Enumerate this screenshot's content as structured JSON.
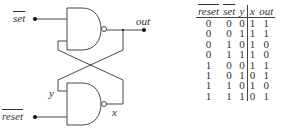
{
  "circuit": {
    "inputs": [
      {
        "name": "set",
        "label": "set",
        "overline": true
      },
      {
        "name": "reset",
        "label": "reset",
        "overline": true
      }
    ],
    "outputs": [
      {
        "name": "out",
        "label": "out"
      }
    ],
    "internal_labels": {
      "y": "y",
      "x": "x"
    },
    "gates": [
      {
        "type": "NAND",
        "inputs": [
          "set",
          "x"
        ],
        "output": "out"
      },
      {
        "type": "NAND",
        "inputs": [
          "y",
          "reset"
        ],
        "output": "x"
      }
    ],
    "line_color": "#333333"
  },
  "truth_table": {
    "headers": [
      "reset",
      "set",
      "y",
      "x",
      "out"
    ],
    "overlined_headers": [
      "reset",
      "set"
    ],
    "rows": [
      [
        "0",
        "0",
        "0",
        "1",
        "1"
      ],
      [
        "0",
        "0",
        "1",
        "1",
        "1"
      ],
      [
        "0",
        "1",
        "0",
        "1",
        "0"
      ],
      [
        "0",
        "1",
        "1",
        "1",
        "0"
      ],
      [
        "1",
        "0",
        "0",
        "1",
        "1"
      ],
      [
        "1",
        "0",
        "1",
        "0",
        "1"
      ],
      [
        "1",
        "1",
        "0",
        "1",
        "0"
      ],
      [
        "1",
        "1",
        "1",
        "0",
        "1"
      ]
    ]
  }
}
